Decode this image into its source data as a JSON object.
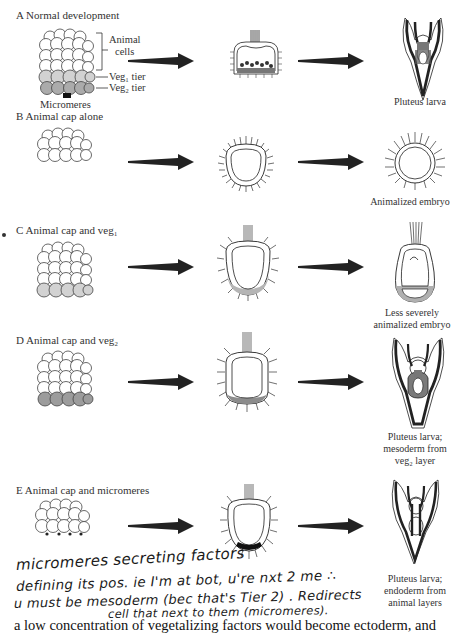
{
  "figure": {
    "panels": [
      {
        "id": "A",
        "label": "A  Normal development",
        "annotations": {
          "animal_cells": [
            "Animal",
            "cells"
          ],
          "veg1": "Veg₁ tier",
          "veg2": "Veg₂ tier",
          "micromeres": "Micromeres"
        },
        "result_caption": [
          "Pluteus larva"
        ]
      },
      {
        "id": "B",
        "label": "B  Animal cap alone",
        "result_caption": [
          "Animalized embryo"
        ]
      },
      {
        "id": "C",
        "label": "C  Animal cap and veg₁",
        "result_caption": [
          "Less severely",
          "animalized embryo"
        ]
      },
      {
        "id": "D",
        "label": "D  Animal cap and veg₂",
        "result_caption": [
          "Pluteus larva;",
          "mesoderm from",
          "veg₂ layer"
        ]
      },
      {
        "id": "E",
        "label": "E  Animal cap and micromeres",
        "result_caption": [
          "Pluteus larva;",
          "endoderm from",
          "animal layers"
        ]
      }
    ],
    "handwritten_note": [
      "micromeres  secreting  factors",
      "defining its pos. ie  I'm at bot, u're nxt 2 me ∴",
      "u must be mesoderm (bec that's Tier 2) . Redirects",
      "cell that next to them (micromeres)."
    ],
    "body_text": "a low concentration of vegetalizing factors would become ectoderm, and",
    "colors": {
      "line": "#1e1e1e",
      "veg1_fill": "#cfcfcf",
      "veg2_fill": "#a8a8a8",
      "mesoderm_fill": "#8a8a8a",
      "arrow": "#222222"
    }
  }
}
